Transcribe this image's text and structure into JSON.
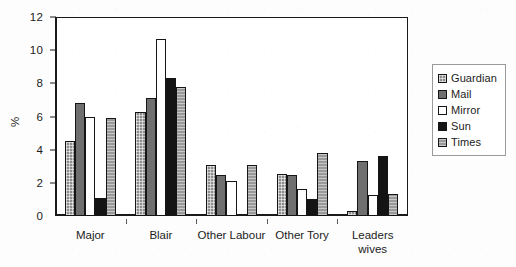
{
  "chart_data": {
    "type": "bar",
    "title": "",
    "xlabel": "",
    "ylabel": "%",
    "ylim": [
      0,
      12
    ],
    "yticks": [
      0,
      2,
      4,
      6,
      8,
      10,
      12
    ],
    "grid": false,
    "legend_position": "right",
    "categories": [
      "Major",
      "Blair",
      "Other Labour",
      "Other Tory",
      "Leaders wives"
    ],
    "category_labels": [
      [
        "Major"
      ],
      [
        "Blair"
      ],
      [
        "Other Labour"
      ],
      [
        "Other Tory"
      ],
      [
        "Leaders",
        "wives"
      ]
    ],
    "series": [
      {
        "name": "Guardian",
        "fill": "cross-hatch-gray",
        "color": "#8e8e8e",
        "values": [
          4.5,
          6.3,
          3.1,
          2.55,
          0.3
        ]
      },
      {
        "name": "Mail",
        "fill": "solid-gray",
        "color": "#6f6f6f",
        "values": [
          6.8,
          7.1,
          2.5,
          2.45,
          3.3
        ]
      },
      {
        "name": "Mirror",
        "fill": "white",
        "color": "#ffffff",
        "values": [
          6.0,
          10.7,
          2.1,
          1.6,
          1.25
        ]
      },
      {
        "name": "Sun",
        "fill": "solid-black",
        "color": "#141414",
        "values": [
          1.1,
          8.35,
          0.0,
          1.05,
          3.6
        ]
      },
      {
        "name": "Times",
        "fill": "light-gray-hatch",
        "color": "#999999",
        "values": [
          5.9,
          7.8,
          3.1,
          3.8,
          1.3
        ]
      }
    ]
  },
  "legend": {
    "entries": [
      {
        "label": "Guardian"
      },
      {
        "label": "Mail"
      },
      {
        "label": "Mirror"
      },
      {
        "label": "Sun"
      },
      {
        "label": "Times"
      }
    ]
  },
  "colors": {
    "axis": "#1a1a1a",
    "text": "#1c1c1c",
    "plot_background": "#ffffff",
    "page_background": "#fdfdfd",
    "legend_border": "#9a9a9a"
  }
}
